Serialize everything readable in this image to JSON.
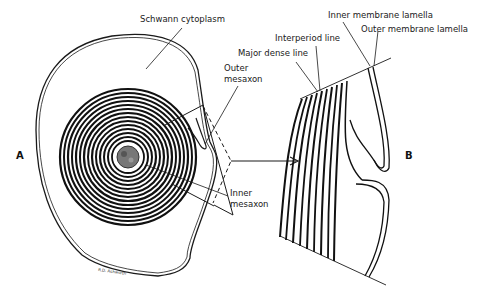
{
  "figure": {
    "panel_a": {
      "letter": "A",
      "labels": {
        "schwann_cytoplasm": "Schwann cytoplasm",
        "outer_mesaxon_line1": "Outer",
        "outer_mesaxon_line2": "mesaxon",
        "inner_mesaxon_line1": "Inner",
        "inner_mesaxon_line2": "mesaxon"
      },
      "signature": "R.D. Ashworth"
    },
    "panel_b": {
      "letter": "B",
      "labels": {
        "inner_membrane_lamella": "Inner membrane lamella",
        "outer_membrane_lamella": "Outer membrane lamella",
        "interperiod_line": "Interperiod line",
        "major_dense_line": "Major dense line"
      }
    },
    "colors": {
      "ink": "#1a1a1a",
      "background": "#ffffff"
    }
  }
}
